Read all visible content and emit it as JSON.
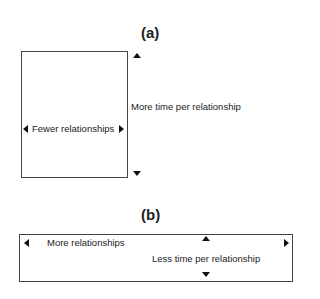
{
  "panel_a": {
    "title": "(a)",
    "horizontal_label": "Fewer relationships",
    "vertical_label": "More time per relationship"
  },
  "panel_b": {
    "title": "(b)",
    "horizontal_label": "More relationships",
    "vertical_label": "Less time per relationship"
  }
}
